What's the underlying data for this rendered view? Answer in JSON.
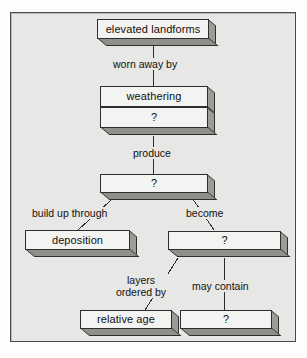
{
  "diagram": {
    "background_color": "#e7e7e5",
    "box_fill_color": "#f3f3f1",
    "box_shadow_color": "#9c9c99",
    "border_color": "#2e2e2e",
    "text_color": "#101010",
    "nodes": [
      {
        "id": "n1",
        "label": "elevated landforms"
      },
      {
        "id": "n2",
        "label": "weathering"
      },
      {
        "id": "n3",
        "label": "?"
      },
      {
        "id": "n4",
        "label": "?"
      },
      {
        "id": "n5",
        "label": "deposition"
      },
      {
        "id": "n6",
        "label": "?"
      },
      {
        "id": "n7",
        "label": "relative age"
      },
      {
        "id": "n8",
        "label": "?"
      }
    ],
    "edges": [
      {
        "id": "e1",
        "label": "worn away by",
        "from": "n1",
        "to": "n2"
      },
      {
        "id": "e2",
        "label": "produce",
        "from": "n3",
        "to": "n4"
      },
      {
        "id": "e3",
        "label": "build up through",
        "from": "n4",
        "to": "n5"
      },
      {
        "id": "e4",
        "label": "become",
        "from": "n4",
        "to": "n6"
      },
      {
        "id": "e5",
        "label_line1": "layers",
        "label_line2": "ordered by",
        "from": "n6",
        "to": "n7"
      },
      {
        "id": "e6",
        "label": "may contain",
        "from": "n6",
        "to": "n8"
      }
    ]
  }
}
